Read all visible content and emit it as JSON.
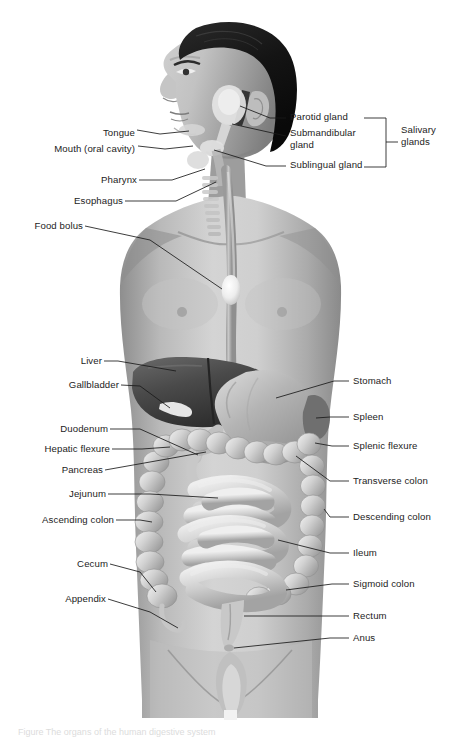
{
  "figure": {
    "style": "grayscale medical illustration, male torso anterior view, head in three-quarter left profile",
    "background_color": "#ffffff",
    "label_color": "#1c1c1c",
    "leader_line_color": "#1a1a1a"
  },
  "bracket": {
    "label_line1": "Salivary",
    "label_line2": "glands",
    "groups": [
      "Parotid gland",
      "Submandibular gland",
      "Sublingual gland"
    ]
  },
  "labels_left": [
    {
      "text": "Tongue",
      "x": 95,
      "y": 133
    },
    {
      "text": "Mouth (oral cavity)",
      "x": 33,
      "y": 149
    },
    {
      "text": "Pharynx",
      "x": 101,
      "y": 183
    },
    {
      "text": "Esophagus",
      "x": 61,
      "y": 204
    },
    {
      "text": "Food bolus",
      "x": 18,
      "y": 229
    },
    {
      "text": "Liver",
      "x": 84,
      "y": 364
    },
    {
      "text": "Gallbladder",
      "x": 54,
      "y": 388
    },
    {
      "text": "Duodenum",
      "x": 52,
      "y": 432
    },
    {
      "text": "Hepatic flexure",
      "x": 34,
      "y": 452
    },
    {
      "text": "Pancreas",
      "x": 63,
      "y": 473
    },
    {
      "text": "Jejunum",
      "x": 66,
      "y": 497
    },
    {
      "text": "Ascending colon",
      "x": 26,
      "y": 523
    },
    {
      "text": "Cecum",
      "x": 72,
      "y": 567
    },
    {
      "text": "Appendix",
      "x": 57,
      "y": 602
    }
  ],
  "labels_right": [
    {
      "text": "Parotid gland",
      "x": 290,
      "y": 116
    },
    {
      "text": "Submandibular",
      "x": 290,
      "y": 132
    },
    {
      "text": "gland",
      "x": 290,
      "y": 144
    },
    {
      "text": "Sublingual gland",
      "x": 290,
      "y": 164
    },
    {
      "text": "Stomach",
      "x": 353,
      "y": 377
    },
    {
      "text": "Spleen",
      "x": 353,
      "y": 413
    },
    {
      "text": "Splenic flexure",
      "x": 353,
      "y": 442
    },
    {
      "text": "Transverse colon",
      "x": 353,
      "y": 477
    },
    {
      "text": "Descending colon",
      "x": 353,
      "y": 513
    },
    {
      "text": "Ileum",
      "x": 353,
      "y": 549
    },
    {
      "text": "Sigmoid colon",
      "x": 353,
      "y": 580
    },
    {
      "text": "Rectum",
      "x": 353,
      "y": 612
    },
    {
      "text": "Anus",
      "x": 353,
      "y": 634
    }
  ],
  "organs": [
    "tongue",
    "mouth",
    "parotid gland",
    "submandibular gland",
    "sublingual gland",
    "pharynx",
    "esophagus",
    "food bolus",
    "liver",
    "gallbladder",
    "stomach",
    "spleen",
    "duodenum",
    "pancreas",
    "jejunum",
    "ileum",
    "cecum",
    "appendix",
    "ascending colon",
    "hepatic flexure",
    "transverse colon",
    "splenic flexure",
    "descending colon",
    "sigmoid colon",
    "rectum",
    "anus"
  ],
  "caption": "Figure  The organs of the human digestive system"
}
